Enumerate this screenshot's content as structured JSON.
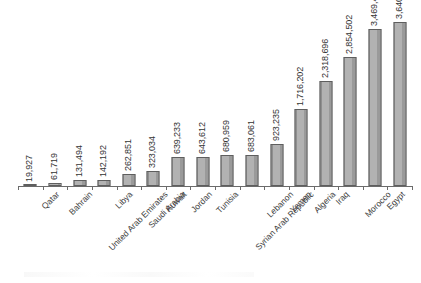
{
  "chart_data": {
    "type": "bar",
    "title": "",
    "subtitle": "",
    "xlabel": "",
    "ylabel": "",
    "grid": false,
    "legend": false,
    "orientation": "vertical",
    "sorted": "ascending",
    "ylim": [
      0,
      3900000
    ],
    "bar_color": "#a5a5a5",
    "bar_border_color": "#5e5e5e",
    "value_label_rotation": -90,
    "category_label_rotation": -45,
    "categories": [
      "Qatar",
      "Bahrain",
      "United Arab Emirates",
      "Libya",
      "Saudi Arabia",
      "Kuwait",
      "Jordan",
      "Tunisia",
      "Syrian Arab Republic",
      "Lebanon",
      "Yemen",
      "Algeria",
      "Iraq",
      "Morocco",
      "Egypt",
      "State of Palestine"
    ],
    "values": [
      19927,
      61719,
      131494,
      142192,
      262851,
      323034,
      639233,
      643612,
      680959,
      683061,
      923235,
      1716202,
      2318696,
      2854502,
      3469449,
      3640155
    ],
    "value_labels": [
      "19,927",
      "61,719",
      "131,494",
      "142,192",
      "262,851",
      "323,034",
      "639,233",
      "643,612",
      "680,959",
      "683,061",
      "923,235",
      "1,716,202",
      "2,318,696",
      "2,854,502",
      "3,469,449",
      "3,640,155"
    ]
  }
}
